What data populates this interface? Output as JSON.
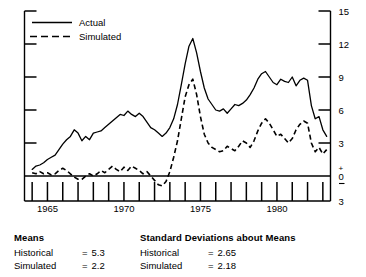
{
  "chart_data": {
    "type": "line",
    "title": "",
    "xlabel": "",
    "ylabel": "",
    "xlim": [
      1963.5,
      1983.5
    ],
    "ylim": [
      -3,
      15
    ],
    "grid": false,
    "legend_position": "top-left",
    "yticks": [
      15,
      12,
      9,
      6,
      3,
      0,
      -3
    ],
    "ytick_labels": [
      "15",
      "12",
      "9",
      "6",
      "3",
      "+0–",
      "3"
    ],
    "xticks": [
      1964,
      1965,
      1966,
      1967,
      1968,
      1969,
      1970,
      1971,
      1972,
      1973,
      1974,
      1975,
      1976,
      1977,
      1978,
      1979,
      1980,
      1981,
      1982,
      1983
    ],
    "xtick_labels_shown": [
      "1965",
      "1970",
      "1975",
      "1980"
    ],
    "xtick_labels_positions": [
      1965,
      1970,
      1975,
      1980
    ],
    "series": [
      {
        "name": "Actual",
        "style": "solid",
        "x": [
          1964.0,
          1964.25,
          1964.5,
          1964.75,
          1965.0,
          1965.25,
          1965.5,
          1965.75,
          1966.0,
          1966.25,
          1966.5,
          1966.75,
          1967.0,
          1967.25,
          1967.5,
          1967.75,
          1968.0,
          1968.25,
          1968.5,
          1968.75,
          1969.0,
          1969.25,
          1969.5,
          1969.75,
          1970.0,
          1970.25,
          1970.5,
          1970.75,
          1971.0,
          1971.25,
          1971.5,
          1971.75,
          1972.0,
          1972.25,
          1972.5,
          1972.75,
          1973.0,
          1973.25,
          1973.5,
          1973.75,
          1974.0,
          1974.25,
          1974.5,
          1974.75,
          1975.0,
          1975.25,
          1975.5,
          1975.75,
          1976.0,
          1976.25,
          1976.5,
          1976.75,
          1977.0,
          1977.25,
          1977.5,
          1977.75,
          1978.0,
          1978.25,
          1978.5,
          1978.75,
          1979.0,
          1979.25,
          1979.5,
          1979.75,
          1980.0,
          1980.25,
          1980.5,
          1980.75,
          1981.0,
          1981.25,
          1981.5,
          1981.75,
          1982.0,
          1982.25,
          1982.5,
          1982.75,
          1983.0,
          1983.25
        ],
        "values": [
          0.6,
          0.9,
          1.0,
          1.2,
          1.5,
          1.7,
          1.9,
          2.4,
          2.9,
          3.3,
          3.6,
          4.2,
          3.9,
          3.2,
          3.6,
          3.3,
          3.9,
          4.0,
          4.1,
          4.4,
          4.7,
          5.0,
          5.3,
          5.6,
          5.5,
          5.9,
          5.6,
          5.4,
          5.7,
          5.4,
          4.9,
          4.4,
          4.2,
          3.9,
          3.6,
          3.9,
          4.4,
          5.2,
          6.5,
          8.3,
          10.2,
          11.8,
          12.5,
          11.2,
          9.5,
          8.0,
          7.0,
          6.5,
          6.0,
          5.9,
          6.1,
          5.7,
          6.1,
          6.5,
          6.4,
          6.6,
          6.9,
          7.4,
          8.0,
          8.8,
          9.3,
          9.5,
          9.0,
          8.5,
          8.3,
          8.8,
          8.6,
          8.5,
          9.0,
          8.2,
          8.7,
          8.9,
          8.7,
          6.4,
          5.2,
          5.4,
          4.2,
          3.6
        ]
      },
      {
        "name": "Simulated",
        "style": "dashed",
        "x": [
          1964.0,
          1964.25,
          1964.5,
          1964.75,
          1965.0,
          1965.25,
          1965.5,
          1965.75,
          1966.0,
          1966.25,
          1966.5,
          1966.75,
          1967.0,
          1967.25,
          1967.5,
          1967.75,
          1968.0,
          1968.25,
          1968.5,
          1968.75,
          1969.0,
          1969.25,
          1969.5,
          1969.75,
          1970.0,
          1970.25,
          1970.5,
          1970.75,
          1971.0,
          1971.25,
          1971.5,
          1971.75,
          1972.0,
          1972.25,
          1972.5,
          1972.75,
          1973.0,
          1973.25,
          1973.5,
          1973.75,
          1974.0,
          1974.25,
          1974.5,
          1974.75,
          1975.0,
          1975.25,
          1975.5,
          1975.75,
          1976.0,
          1976.25,
          1976.5,
          1976.75,
          1977.0,
          1977.25,
          1977.5,
          1977.75,
          1978.0,
          1978.25,
          1978.5,
          1978.75,
          1979.0,
          1979.25,
          1979.5,
          1979.75,
          1980.0,
          1980.25,
          1980.5,
          1980.75,
          1981.0,
          1981.25,
          1981.5,
          1981.75,
          1982.0,
          1982.25,
          1982.5,
          1982.75,
          1983.0,
          1983.25
        ],
        "values": [
          0.3,
          0.2,
          0.4,
          0.2,
          0.3,
          0.1,
          0.2,
          0.5,
          0.7,
          0.5,
          0.2,
          -0.1,
          -0.3,
          -0.3,
          0.0,
          0.2,
          0.0,
          0.2,
          0.5,
          0.3,
          0.6,
          0.9,
          0.6,
          0.4,
          0.8,
          0.5,
          0.9,
          0.7,
          0.5,
          0.2,
          0.4,
          0.0,
          -0.4,
          -0.8,
          -0.9,
          -0.5,
          0.4,
          1.7,
          3.2,
          5.2,
          7.2,
          8.3,
          8.8,
          7.4,
          5.4,
          3.8,
          3.0,
          2.6,
          2.4,
          2.2,
          2.3,
          2.7,
          2.5,
          2.3,
          2.7,
          3.2,
          3.0,
          2.6,
          3.2,
          4.1,
          4.8,
          5.2,
          4.8,
          4.2,
          3.6,
          3.8,
          3.4,
          3.0,
          3.4,
          4.2,
          4.7,
          5.0,
          4.8,
          3.0,
          2.2,
          2.6,
          2.0,
          2.4
        ]
      }
    ],
    "annotations": {
      "means_heading": "Means",
      "stddev_heading": "Standard Deviations about Means",
      "means_historical_label": "Historical",
      "means_historical_value": "5.3",
      "means_simulated_label": "Simulated",
      "means_simulated_value": "2.2",
      "sd_historical_label": "Historical",
      "sd_historical_value": "2.65",
      "sd_simulated_label": "Simulated",
      "sd_simulated_value": "2.18",
      "equals": "="
    }
  },
  "legend": {
    "actual": "Actual",
    "simulated": "Simulated"
  },
  "axis": {
    "y_labels": [
      "15",
      "12",
      "9",
      "6",
      "3",
      "3"
    ],
    "zero_plus": "+",
    "zero_digit": "0",
    "zero_minus": "–",
    "x_labels": [
      "1965",
      "1970",
      "1975",
      "1980"
    ]
  },
  "colors": {
    "ink": "#000000",
    "background": "#ffffff"
  }
}
